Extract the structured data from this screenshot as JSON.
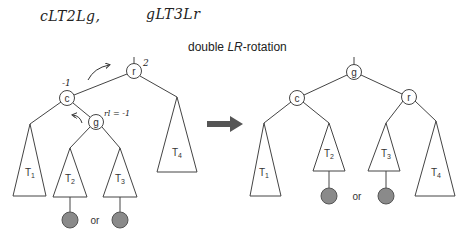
{
  "annotations": {
    "handwritten_left": "cLT2Lg,",
    "handwritten_right": "gLT3Lr",
    "balance_r": "2",
    "balance_c": "-1",
    "balance_g": "rl = -1"
  },
  "title": {
    "prefix": "double ",
    "emphasis": "LR",
    "suffix": "-rotation"
  },
  "before_tree": {
    "nodes": {
      "r": "r",
      "c": "c",
      "g": "g"
    },
    "subtrees": {
      "t1": "T1",
      "t2": "T2",
      "t3": "T3",
      "t4": "T4"
    },
    "or_label": "or"
  },
  "after_tree": {
    "nodes": {
      "g": "g",
      "c": "c",
      "r": "r"
    },
    "subtrees": {
      "t1": "T1",
      "t2": "T2",
      "t3": "T3",
      "t4": "T4"
    },
    "or_label": "or"
  },
  "colors": {
    "line": "#444444",
    "leaf_fill": "#8a8a8a",
    "arrow": "#555555"
  }
}
